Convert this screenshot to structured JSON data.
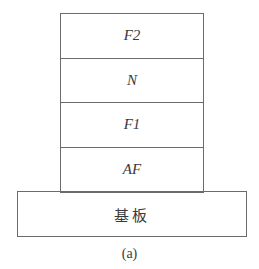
{
  "diagram": {
    "layers": [
      {
        "label": "F2"
      },
      {
        "label": "N"
      },
      {
        "label": "F1"
      },
      {
        "label": "AF"
      }
    ],
    "substrate": {
      "label": "基板"
    },
    "caption": "(a)"
  }
}
